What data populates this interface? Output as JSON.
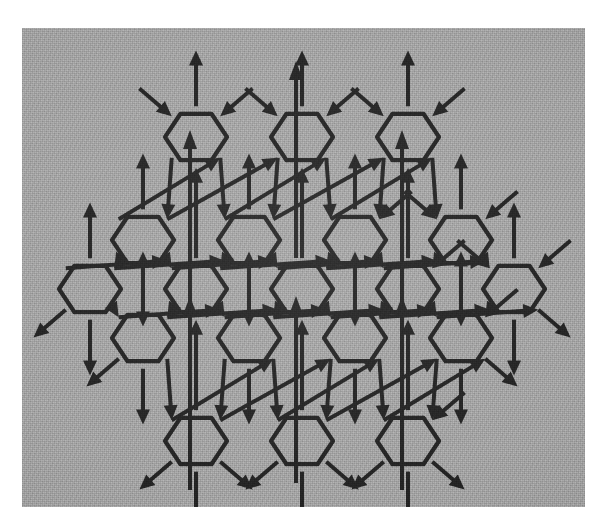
{
  "figure": {
    "title": "Hexagonal lattice network with directed couplings",
    "kind": "diagram",
    "caption": "",
    "plate": {
      "x": 22,
      "y": 28,
      "width": 563,
      "height": 479,
      "background_color": "#9d9d9d",
      "texture": "photographic halftone grain",
      "page_color": "#ffffff"
    },
    "ink_color": "#1c1c1c",
    "node_shape": "hexagon",
    "node_count": 19,
    "node_radius": 31,
    "lattice": {
      "rows": [
        {
          "row_index": 0,
          "node_count": 3,
          "center_y": 137,
          "center_xs": [
            196,
            302,
            408
          ]
        },
        {
          "row_index": 1,
          "node_count": 4,
          "center_y": 240,
          "center_xs": [
            143,
            249,
            355,
            461
          ]
        },
        {
          "row_index": 2,
          "node_count": 5,
          "center_y": 289,
          "center_xs": [
            90,
            196,
            302,
            408,
            514
          ]
        },
        {
          "row_index": 3,
          "node_count": 4,
          "center_y": 338,
          "center_xs": [
            143,
            249,
            355,
            461
          ]
        },
        {
          "row_index": 4,
          "node_count": 3,
          "center_y": 441,
          "center_xs": [
            196,
            302,
            408
          ]
        }
      ],
      "column_pitch": 106,
      "row_pitch": 49,
      "orientation": "pointy-side-horizontal"
    },
    "edges": {
      "style": "single-headed arrow",
      "head_length": 15,
      "head_half_width": 7,
      "directions": [
        "up",
        "up-left",
        "up-right",
        "down-left",
        "down-right"
      ],
      "description": "Each interior hexagon is joined to its neighbours by arrows; every cell also carries free boundary arrows that enter or leave the lattice."
    },
    "legend": [],
    "annotations": []
  },
  "chart_data": {
    "type": "diagram",
    "title": "Hexagonal lattice network with directed couplings",
    "node_label_format": "none",
    "nodes": [
      {
        "id": "n0",
        "row": 0,
        "col": 0,
        "x": 196,
        "y": 137
      },
      {
        "id": "n1",
        "row": 0,
        "col": 1,
        "x": 302,
        "y": 137
      },
      {
        "id": "n2",
        "row": 0,
        "col": 2,
        "x": 408,
        "y": 137
      },
      {
        "id": "n3",
        "row": 1,
        "col": 0,
        "x": 143,
        "y": 240
      },
      {
        "id": "n4",
        "row": 1,
        "col": 1,
        "x": 249,
        "y": 240
      },
      {
        "id": "n5",
        "row": 1,
        "col": 2,
        "x": 355,
        "y": 240
      },
      {
        "id": "n6",
        "row": 1,
        "col": 3,
        "x": 461,
        "y": 240
      },
      {
        "id": "n7",
        "row": 2,
        "col": 0,
        "x": 90,
        "y": 289
      },
      {
        "id": "n8",
        "row": 2,
        "col": 1,
        "x": 196,
        "y": 289
      },
      {
        "id": "n9",
        "row": 2,
        "col": 2,
        "x": 302,
        "y": 289
      },
      {
        "id": "n10",
        "row": 2,
        "col": 3,
        "x": 408,
        "y": 289
      },
      {
        "id": "n11",
        "row": 2,
        "col": 4,
        "x": 514,
        "y": 289
      },
      {
        "id": "n12",
        "row": 3,
        "col": 0,
        "x": 143,
        "y": 338
      },
      {
        "id": "n13",
        "row": 3,
        "col": 1,
        "x": 249,
        "y": 338
      },
      {
        "id": "n14",
        "row": 3,
        "col": 2,
        "x": 355,
        "y": 338
      },
      {
        "id": "n15",
        "row": 3,
        "col": 3,
        "x": 461,
        "y": 338
      },
      {
        "id": "n16",
        "row": 4,
        "col": 0,
        "x": 196,
        "y": 441
      },
      {
        "id": "n17",
        "row": 4,
        "col": 1,
        "x": 302,
        "y": 441
      },
      {
        "id": "n18",
        "row": 4,
        "col": 2,
        "x": 408,
        "y": 441
      }
    ],
    "note": "19 hexagonal cells, each with six incident directed arrows (three in, three out)."
  }
}
